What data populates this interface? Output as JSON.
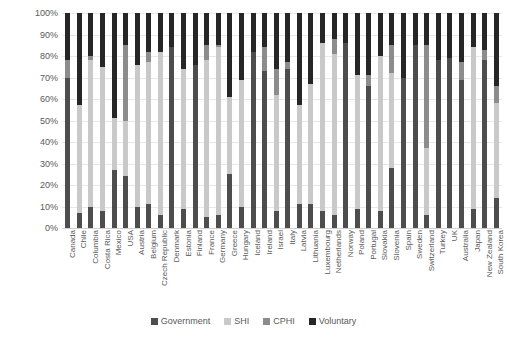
{
  "chart_data": {
    "type": "bar",
    "subtype": "100% stacked bar",
    "title": "",
    "xlabel": "",
    "ylabel": "% of current health expenditure",
    "ylim": [
      0,
      100
    ],
    "ytick_labels": [
      "100%",
      "90%",
      "80%",
      "70%",
      "60%",
      "50%",
      "40%",
      "30%",
      "20%",
      "10%",
      "0%"
    ],
    "ytick_values": [
      100,
      90,
      80,
      70,
      60,
      50,
      40,
      30,
      20,
      10,
      0
    ],
    "grid": true,
    "legend_position": "bottom",
    "colors": {
      "Government": "#4d4d4d",
      "SHI": "#c9c9c9",
      "CPHI": "#8c8c8c",
      "Voluntary": "#262626"
    },
    "legend": [
      "Government",
      "SHI",
      "CPHI",
      "Voluntary"
    ],
    "categories": [
      "Canada",
      "Chile",
      "Columbia",
      "Costa Rica",
      "Mexico",
      "USA",
      "Austria",
      "Belgium",
      "Czech Republic",
      "Denmark",
      "Estonia",
      "Finland",
      "France",
      "Germany",
      "Greece",
      "Hungary",
      "Iceland",
      "Ireland",
      "Israel",
      "Italy",
      "Latvia",
      "Lithuania",
      "Luxembourg",
      "Netherlands",
      "Norway",
      "Poland",
      "Portugal",
      "Slovakia",
      "Slovenia",
      "Spain",
      "Sweden",
      "Switzerland",
      "Turkey",
      "UK",
      "Australia",
      "Japan",
      "New Zealand",
      "South Korea"
    ],
    "series": [
      {
        "name": "Government",
        "values": [
          70,
          7,
          10,
          8,
          27,
          24,
          10,
          11,
          6,
          84,
          9,
          76,
          5,
          6,
          25,
          10,
          82,
          73,
          8,
          74,
          11,
          11,
          8,
          6,
          86,
          9,
          66,
          8,
          28,
          70,
          85,
          6,
          78,
          79,
          69,
          9,
          78,
          14
        ]
      },
      {
        "name": "SHI",
        "values": [
          0,
          50,
          68,
          67,
          24,
          26,
          66,
          66,
          76,
          0,
          65,
          0,
          73,
          78,
          36,
          59,
          0,
          0,
          54,
          0,
          46,
          56,
          78,
          75,
          0,
          62,
          0,
          72,
          44,
          0,
          0,
          31,
          0,
          0,
          0,
          75,
          0,
          44
        ]
      },
      {
        "name": "CPHI",
        "values": [
          8,
          0,
          2,
          0,
          0,
          35,
          0,
          5,
          0,
          0,
          0,
          0,
          7,
          1,
          0,
          0,
          0,
          11,
          12,
          3,
          0,
          0,
          0,
          7,
          0,
          0,
          5,
          0,
          13,
          0,
          0,
          48,
          0,
          0,
          8,
          0,
          5,
          8
        ]
      },
      {
        "name": "Voluntary",
        "values": [
          22,
          43,
          20,
          25,
          49,
          15,
          24,
          18,
          18,
          16,
          26,
          24,
          15,
          15,
          39,
          31,
          18,
          16,
          26,
          23,
          43,
          33,
          14,
          12,
          14,
          29,
          29,
          20,
          15,
          30,
          15,
          15,
          22,
          21,
          23,
          16,
          17,
          34
        ]
      }
    ]
  },
  "legend_items": [
    {
      "label": "Government",
      "color": "#4d4d4d"
    },
    {
      "label": "SHI",
      "color": "#c9c9c9"
    },
    {
      "label": "CPHI",
      "color": "#8c8c8c"
    },
    {
      "label": "Voluntary",
      "color": "#262626"
    }
  ]
}
